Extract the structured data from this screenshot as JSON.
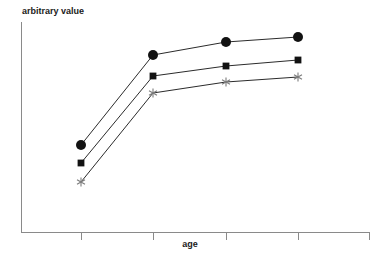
{
  "chart_data": {
    "type": "line",
    "title": "",
    "xlabel": "age",
    "ylabel": "arbitrary value",
    "grid": false,
    "legend": "none",
    "x": [
      1,
      2,
      3,
      4
    ],
    "x_tick_labels": [
      "",
      "",
      "",
      ""
    ],
    "y_tick_labels": [],
    "xlim": [
      0.5,
      4.5
    ],
    "ylim": [
      0,
      100
    ],
    "axis_color": "#8a8a8a",
    "line_color": "#2b2b2b",
    "series": [
      {
        "name": "series-circle",
        "marker": "circle",
        "marker_color": "#121212",
        "values": [
          41,
          85,
          91,
          93
        ]
      },
      {
        "name": "series-square",
        "marker": "square",
        "marker_color": "#121212",
        "values": [
          33,
          75,
          79,
          82
        ]
      },
      {
        "name": "series-asterisk",
        "marker": "asterisk",
        "marker_color": "#7c7c7c",
        "values": [
          24,
          66,
          71,
          74
        ]
      }
    ],
    "pixel_geometry": {
      "y_axis_x": 21,
      "y_axis_top": 22,
      "axis_baseline_y": 232,
      "x_axis_right": 370,
      "tick_x": [
        81,
        153,
        226,
        298,
        370
      ],
      "tick_length": 7,
      "points_px": {
        "series-circle": [
          [
            81,
            145
          ],
          [
            153,
            55
          ],
          [
            226,
            42
          ],
          [
            298,
            37
          ]
        ],
        "series-square": [
          [
            81,
            163
          ],
          [
            153,
            76
          ],
          [
            226,
            66
          ],
          [
            298,
            60
          ]
        ],
        "series-asterisk": [
          [
            81,
            182
          ],
          [
            153,
            93
          ],
          [
            226,
            82
          ],
          [
            298,
            77
          ]
        ]
      },
      "ylabel_px": [
        22,
        14
      ],
      "xlabel_px": [
        190,
        244
      ]
    }
  }
}
